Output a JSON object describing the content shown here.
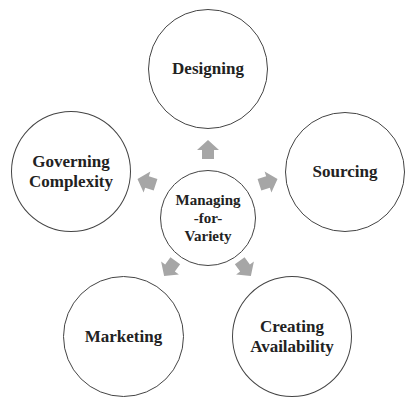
{
  "diagram": {
    "center": {
      "label": "Managing\n-for-\nVariety",
      "cx": 207,
      "cy": 217,
      "r": 48
    },
    "nodes": [
      {
        "id": "designing",
        "label": "Designing",
        "cx": 208,
        "cy": 69,
        "r": 60
      },
      {
        "id": "sourcing",
        "label": "Sourcing",
        "cx": 345,
        "cy": 172,
        "r": 60
      },
      {
        "id": "creating-availability",
        "label": "Creating\nAvailability",
        "cx": 292,
        "cy": 336,
        "r": 60
      },
      {
        "id": "marketing",
        "label": "Marketing",
        "cx": 123,
        "cy": 336,
        "r": 60
      },
      {
        "id": "governing-complexity",
        "label": "Governing\nComplexity",
        "cx": 71,
        "cy": 172,
        "r": 60
      }
    ],
    "arrow_color": "#a6a6a6",
    "line_color": "#444444"
  }
}
